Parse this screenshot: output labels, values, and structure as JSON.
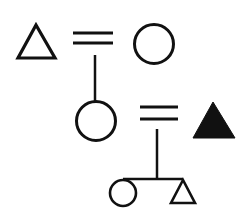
{
  "diagram": {
    "type": "kinship-chart",
    "stroke_color": "#111111",
    "fill_color": "#111111",
    "background": "#ffffff",
    "nodes": [
      {
        "id": "gen1-male",
        "symbol": "triangle",
        "filled": false,
        "meaning": "male"
      },
      {
        "id": "gen1-female",
        "symbol": "circle",
        "filled": false,
        "meaning": "female"
      },
      {
        "id": "gen2-female",
        "symbol": "circle",
        "filled": false,
        "meaning": "female"
      },
      {
        "id": "gen2-ego-male",
        "symbol": "triangle",
        "filled": true,
        "meaning": "male (ego)"
      },
      {
        "id": "gen3-female",
        "symbol": "circle",
        "filled": false,
        "meaning": "female"
      },
      {
        "id": "gen3-male",
        "symbol": "triangle",
        "filled": false,
        "meaning": "male"
      }
    ],
    "relations": [
      {
        "type": "marriage",
        "from": "gen1-male",
        "to": "gen1-female",
        "symbol": "="
      },
      {
        "type": "descent",
        "from": "gen1-marriage",
        "to": "gen2-female"
      },
      {
        "type": "marriage",
        "from": "gen2-female",
        "to": "gen2-ego-male",
        "symbol": "="
      },
      {
        "type": "descent",
        "from": "gen2-marriage",
        "to": [
          "gen3-female",
          "gen3-male"
        ]
      }
    ]
  }
}
